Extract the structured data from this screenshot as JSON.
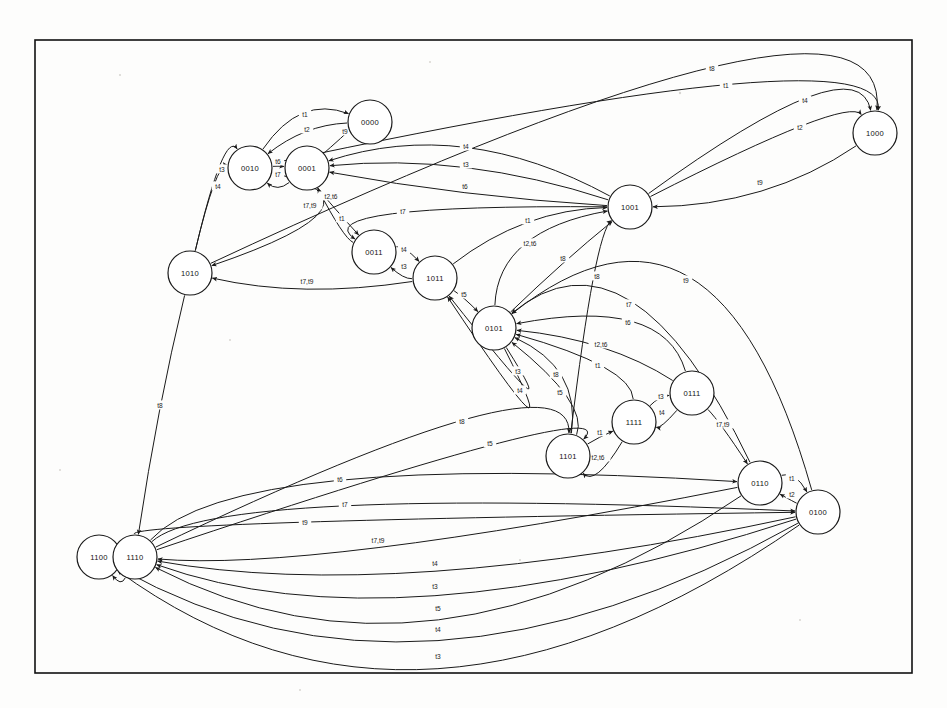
{
  "diagram": {
    "type": "state-machine",
    "node_shape": "circle",
    "node_radius": 22,
    "frame": {
      "x": 35,
      "y": 40,
      "width": 877,
      "height": 633
    },
    "colors": {
      "stroke": "#1a1a1a",
      "node_fill": "#ffffff",
      "background": "#fdfdfc",
      "frame": "#111111"
    },
    "nodes": [
      {
        "id": "0000",
        "label": "0000",
        "x": 370,
        "y": 122
      },
      {
        "id": "0001",
        "label": "0001",
        "x": 307,
        "y": 168
      },
      {
        "id": "0010",
        "label": "0010",
        "x": 250,
        "y": 168
      },
      {
        "id": "0011",
        "label": "0011",
        "x": 374,
        "y": 252
      },
      {
        "id": "0100",
        "label": "0100",
        "x": 818,
        "y": 512
      },
      {
        "id": "0101",
        "label": "0101",
        "x": 494,
        "y": 328
      },
      {
        "id": "0110",
        "label": "0110",
        "x": 760,
        "y": 483
      },
      {
        "id": "0111",
        "label": "0111",
        "x": 692,
        "y": 393
      },
      {
        "id": "1000",
        "label": "1000",
        "x": 875,
        "y": 133
      },
      {
        "id": "1001",
        "label": "1001",
        "x": 630,
        "y": 207
      },
      {
        "id": "1010",
        "label": "1010",
        "x": 190,
        "y": 273
      },
      {
        "id": "1011",
        "label": "1011",
        "x": 435,
        "y": 278
      },
      {
        "id": "1100",
        "label": "1100",
        "x": 99,
        "y": 557
      },
      {
        "id": "1101",
        "label": "1101",
        "x": 568,
        "y": 456
      },
      {
        "id": "1110",
        "label": "1110",
        "x": 135,
        "y": 557
      },
      {
        "id": "1111",
        "label": "1111",
        "x": 634,
        "y": 422
      }
    ],
    "transition_labels": [
      "t1",
      "t2",
      "t3",
      "t4",
      "t5",
      "t6",
      "t7",
      "t8",
      "t9",
      "t2,t6",
      "t7,t9"
    ],
    "edges": [
      {
        "from": "1010",
        "to": "1000",
        "label": "t8",
        "lx": 712,
        "ly": 68
      },
      {
        "from": "0010",
        "to": "1000",
        "label": "t1",
        "lx": 726,
        "ly": 85
      },
      {
        "from": "1001",
        "to": "1000",
        "label": "t4",
        "lx": 805,
        "ly": 100
      },
      {
        "from": "1001",
        "to": "1000",
        "label": "t2",
        "lx": 800,
        "ly": 127
      },
      {
        "from": "0010",
        "to": "0000",
        "label": "t1",
        "lx": 305,
        "ly": 114
      },
      {
        "from": "0000",
        "to": "0010",
        "label": "t2",
        "lx": 307,
        "ly": 129
      },
      {
        "from": "0001",
        "to": "0000",
        "label": "t9",
        "lx": 345,
        "ly": 131
      },
      {
        "from": "0010",
        "to": "0001",
        "label": "t6",
        "lx": 278,
        "ly": 161
      },
      {
        "from": "0001",
        "to": "0010",
        "label": "t7",
        "lx": 278,
        "ly": 174
      },
      {
        "from": "1010",
        "to": "0010",
        "label": "t3",
        "lx": 222,
        "ly": 169
      },
      {
        "from": "1010",
        "to": "0010",
        "label": "t4",
        "lx": 218,
        "ly": 186
      },
      {
        "from": "1001",
        "to": "0001",
        "label": "t4",
        "lx": 466,
        "ly": 146
      },
      {
        "from": "1001",
        "to": "0001",
        "label": "t3",
        "lx": 466,
        "ly": 164
      },
      {
        "from": "0001",
        "to": "0011",
        "label": "t2,t6",
        "lx": 331,
        "ly": 196
      },
      {
        "from": "1001",
        "to": "0001",
        "label": "t6",
        "lx": 465,
        "ly": 186
      },
      {
        "from": "0010",
        "to": "1010",
        "label": "t7,t9",
        "lx": 310,
        "ly": 205
      },
      {
        "from": "0011",
        "to": "0001",
        "label": "t1",
        "lx": 342,
        "ly": 218
      },
      {
        "from": "1001",
        "to": "0011",
        "label": "t7",
        "lx": 403,
        "ly": 211
      },
      {
        "from": "1011",
        "to": "1001",
        "label": "t1",
        "lx": 528,
        "ly": 220
      },
      {
        "from": "1000",
        "to": "1001",
        "label": "t9",
        "lx": 760,
        "ly": 182
      },
      {
        "from": "0011",
        "to": "1011",
        "label": "t4",
        "lx": 404,
        "ly": 249
      },
      {
        "from": "1011",
        "to": "0011",
        "label": "t3",
        "lx": 404,
        "ly": 266
      },
      {
        "from": "0101",
        "to": "1001",
        "label": "t2,t6",
        "lx": 530,
        "ly": 243
      },
      {
        "from": "0101",
        "to": "1001",
        "label": "t8",
        "lx": 563,
        "ly": 258
      },
      {
        "from": "1011",
        "to": "1010",
        "label": "t7,t9",
        "lx": 307,
        "ly": 281
      },
      {
        "from": "1101",
        "to": "1001",
        "label": "t8",
        "lx": 597,
        "ly": 276
      },
      {
        "from": "0100",
        "to": "0101",
        "label": "t9",
        "lx": 686,
        "ly": 280
      },
      {
        "from": "1011",
        "to": "0101",
        "label": "t5",
        "lx": 464,
        "ly": 294
      },
      {
        "from": "0110",
        "to": "0101",
        "label": "t7",
        "lx": 629,
        "ly": 304
      },
      {
        "from": "0111",
        "to": "0101",
        "label": "t6",
        "lx": 628,
        "ly": 322
      },
      {
        "from": "0111",
        "to": "0101",
        "label": "t2,t6",
        "lx": 601,
        "ly": 344
      },
      {
        "from": "1111",
        "to": "0101",
        "label": "t1",
        "lx": 598,
        "ly": 365
      },
      {
        "from": "0101",
        "to": "1011",
        "label": "t3",
        "lx": 518,
        "ly": 371
      },
      {
        "from": "0101",
        "to": "1011",
        "label": "t4",
        "lx": 520,
        "ly": 390
      },
      {
        "from": "1101",
        "to": "0101",
        "label": "t8",
        "lx": 556,
        "ly": 374
      },
      {
        "from": "1101",
        "to": "0101",
        "label": "t5",
        "lx": 560,
        "ly": 392
      },
      {
        "from": "1111",
        "to": "0111",
        "label": "t3",
        "lx": 661,
        "ly": 396
      },
      {
        "from": "0111",
        "to": "1111",
        "label": "t4",
        "lx": 662,
        "ly": 412
      },
      {
        "from": "0111",
        "to": "0110",
        "label": "t7,t9",
        "lx": 723,
        "ly": 424
      },
      {
        "from": "1101",
        "to": "1111",
        "label": "t1",
        "lx": 600,
        "ly": 432
      },
      {
        "from": "1111",
        "to": "1101",
        "label": "t2,t6",
        "lx": 598,
        "ly": 457
      },
      {
        "from": "1110",
        "to": "1101",
        "label": "t8",
        "lx": 462,
        "ly": 421
      },
      {
        "from": "1110",
        "to": "1101",
        "label": "t5",
        "lx": 490,
        "ly": 443
      },
      {
        "from": "1010",
        "to": "1110",
        "label": "t8",
        "lx": 160,
        "ly": 405
      },
      {
        "from": "1110",
        "to": "0110",
        "label": "t6",
        "lx": 340,
        "ly": 479
      },
      {
        "from": "0110",
        "to": "0100",
        "label": "t1",
        "lx": 792,
        "ly": 478
      },
      {
        "from": "0100",
        "to": "0110",
        "label": "t2",
        "lx": 792,
        "ly": 494
      },
      {
        "from": "1110",
        "to": "0100",
        "label": "t7",
        "lx": 345,
        "ly": 504
      },
      {
        "from": "1110",
        "to": "0100",
        "label": "t9",
        "lx": 305,
        "ly": 522
      },
      {
        "from": "1100",
        "to": "1110",
        "label": "t1",
        "lx": 119,
        "ly": 550
      },
      {
        "from": "1110",
        "to": "1100",
        "label": "t2",
        "lx": 119,
        "ly": 566
      },
      {
        "from": "0110",
        "to": "1110",
        "label": "t7,t9",
        "lx": 378,
        "ly": 540
      },
      {
        "from": "0100",
        "to": "1110",
        "label": "t4",
        "lx": 435,
        "ly": 563
      },
      {
        "from": "0100",
        "to": "1110",
        "label": "t3",
        "lx": 435,
        "ly": 586
      },
      {
        "from": "0110",
        "to": "1110",
        "label": "t5",
        "lx": 438,
        "ly": 608
      },
      {
        "from": "0100",
        "to": "1100",
        "label": "t4",
        "lx": 438,
        "ly": 629
      },
      {
        "from": "0100",
        "to": "1100",
        "label": "t3",
        "lx": 438,
        "ly": 656
      }
    ]
  }
}
